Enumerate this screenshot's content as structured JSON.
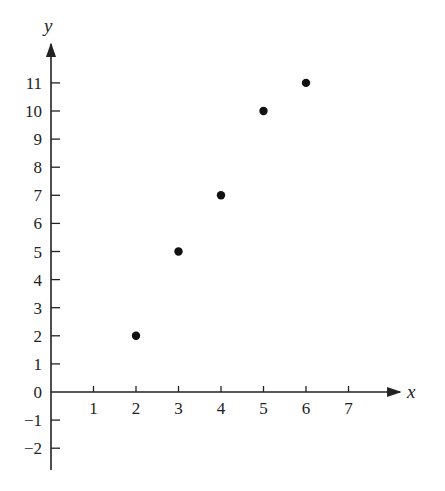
{
  "chart_data": {
    "type": "scatter",
    "title": "",
    "xlabel": "x",
    "ylabel": "y",
    "x": [
      2,
      3,
      4,
      5,
      6
    ],
    "y": [
      2,
      5,
      7,
      10,
      11
    ],
    "points": [
      {
        "x": 2,
        "y": 2
      },
      {
        "x": 3,
        "y": 5
      },
      {
        "x": 4,
        "y": 7
      },
      {
        "x": 5,
        "y": 10
      },
      {
        "x": 6,
        "y": 11
      }
    ],
    "xlim": [
      0,
      8
    ],
    "ylim": [
      -3,
      12
    ],
    "x_ticks": [
      1,
      2,
      3,
      4,
      5,
      6,
      7
    ],
    "y_ticks": [
      -2,
      -1,
      0,
      1,
      2,
      3,
      4,
      5,
      6,
      7,
      8,
      9,
      10,
      11
    ],
    "y_tick_labels": [
      "−2",
      "−1",
      "0",
      "1",
      "2",
      "3",
      "4",
      "5",
      "6",
      "7",
      "8",
      "9",
      "10",
      "11"
    ],
    "grid": false,
    "legend": null,
    "marker_color": "#111111",
    "axis_color": "#222222"
  }
}
